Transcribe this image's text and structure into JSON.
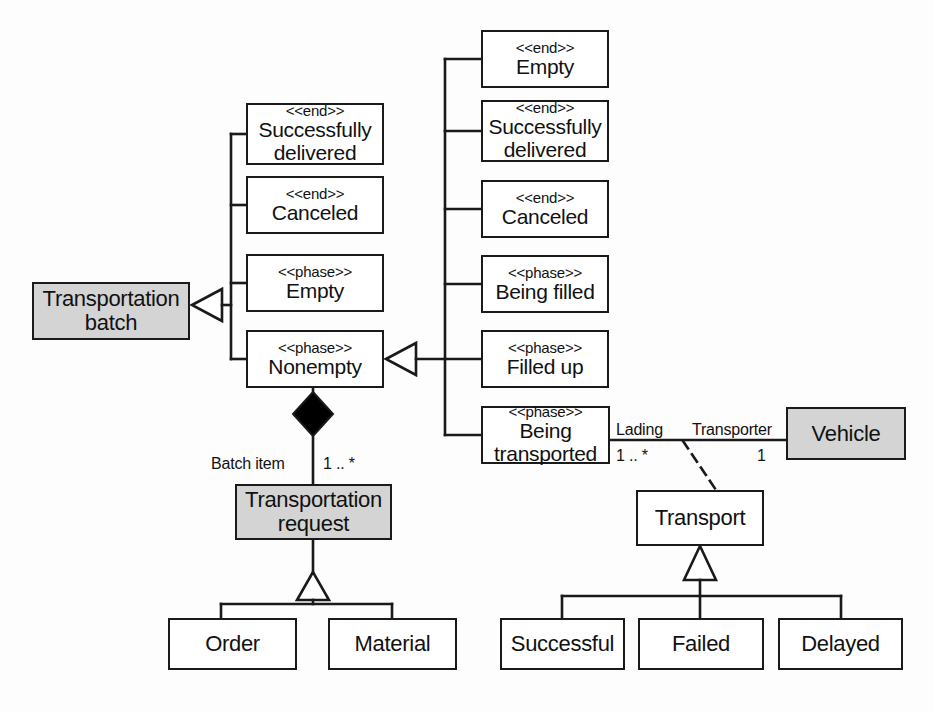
{
  "diagram": {
    "colors": {
      "line": "#1a1a1a",
      "shaded_fill": "#d4d4d4",
      "plain_fill": "#ffffff",
      "text": "#111111",
      "diamond_fill": "#000000"
    },
    "nodes": [
      {
        "id": "transportation-batch",
        "stereotype": "",
        "name": "Transportation\nbatch",
        "shaded": true,
        "x": 32,
        "y": 282,
        "w": 158,
        "h": 58
      },
      {
        "id": "batch-successfully-delivered",
        "stereotype": "<<end>>",
        "name": "Successfully\ndelivered",
        "shaded": false,
        "x": 246,
        "y": 103,
        "w": 138,
        "h": 62
      },
      {
        "id": "batch-canceled",
        "stereotype": "<<end>>",
        "name": "Canceled",
        "shaded": false,
        "x": 246,
        "y": 176,
        "w": 138,
        "h": 58
      },
      {
        "id": "batch-empty",
        "stereotype": "<<phase>>",
        "name": "Empty",
        "shaded": false,
        "x": 246,
        "y": 254,
        "w": 138,
        "h": 58
      },
      {
        "id": "batch-nonempty",
        "stereotype": "<<phase>>",
        "name": "Nonempty",
        "shaded": false,
        "x": 246,
        "y": 330,
        "w": 138,
        "h": 58
      },
      {
        "id": "req-empty",
        "stereotype": "<<end>>",
        "name": "Empty",
        "shaded": false,
        "x": 481,
        "y": 30,
        "w": 128,
        "h": 58
      },
      {
        "id": "req-successfully-delivered",
        "stereotype": "<<end>>",
        "name": "Successfully\ndelivered",
        "shaded": false,
        "x": 481,
        "y": 100,
        "w": 128,
        "h": 62
      },
      {
        "id": "req-canceled",
        "stereotype": "<<end>>",
        "name": "Canceled",
        "shaded": false,
        "x": 481,
        "y": 180,
        "w": 128,
        "h": 58
      },
      {
        "id": "req-being-filled",
        "stereotype": "<<phase>>",
        "name": "Being filled",
        "shaded": false,
        "x": 481,
        "y": 255,
        "w": 128,
        "h": 58
      },
      {
        "id": "req-filled-up",
        "stereotype": "<<phase>>",
        "name": "Filled up",
        "shaded": false,
        "x": 481,
        "y": 330,
        "w": 128,
        "h": 58
      },
      {
        "id": "req-being-transported",
        "stereotype": "<<phase>>",
        "name": "Being\ntransported",
        "shaded": false,
        "x": 481,
        "y": 406,
        "w": 129,
        "h": 58
      },
      {
        "id": "vehicle",
        "stereotype": "",
        "name": "Vehicle",
        "shaded": true,
        "x": 786,
        "y": 407,
        "w": 120,
        "h": 53
      },
      {
        "id": "transportation-request",
        "stereotype": "",
        "name": "Transportation\nrequest",
        "shaded": true,
        "x": 235,
        "y": 484,
        "w": 157,
        "h": 56
      },
      {
        "id": "transport",
        "stereotype": "",
        "name": "Transport",
        "shaded": false,
        "x": 636,
        "y": 490,
        "w": 128,
        "h": 56
      },
      {
        "id": "order",
        "stereotype": "",
        "name": "Order",
        "shaded": false,
        "x": 168,
        "y": 618,
        "w": 129,
        "h": 52
      },
      {
        "id": "material",
        "stereotype": "",
        "name": "Material",
        "shaded": false,
        "x": 328,
        "y": 618,
        "w": 129,
        "h": 52
      },
      {
        "id": "successful",
        "stereotype": "",
        "name": "Successful",
        "shaded": false,
        "x": 500,
        "y": 618,
        "w": 125,
        "h": 52
      },
      {
        "id": "failed",
        "stereotype": "",
        "name": "Failed",
        "shaded": false,
        "x": 638,
        "y": 618,
        "w": 126,
        "h": 52
      },
      {
        "id": "delayed",
        "stereotype": "",
        "name": "Delayed",
        "shaded": false,
        "x": 778,
        "y": 618,
        "w": 125,
        "h": 52
      }
    ],
    "edge_labels": [
      {
        "id": "batch-item-role",
        "text": "Batch item",
        "x": 211,
        "y": 455
      },
      {
        "id": "batch-item-multiplicity",
        "text": "1 .. *",
        "x": 323,
        "y": 455
      },
      {
        "id": "lading-role",
        "text": "Lading",
        "x": 616,
        "y": 421
      },
      {
        "id": "lading-multiplicity",
        "text": "1 .. *",
        "x": 616,
        "y": 447
      },
      {
        "id": "transporter-role",
        "text": "Transporter",
        "x": 692,
        "y": 421
      },
      {
        "id": "transporter-multiplicity",
        "text": "1",
        "x": 757,
        "y": 447
      }
    ]
  }
}
